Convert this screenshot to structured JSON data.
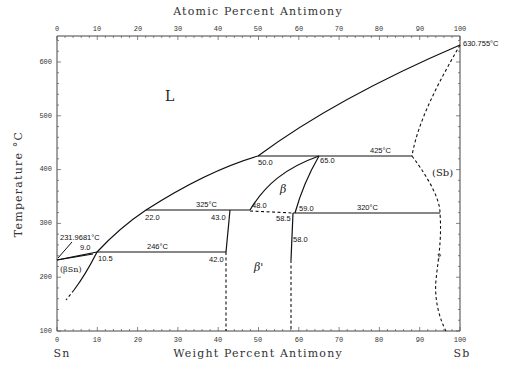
{
  "chart_data": {
    "type": "phase-diagram",
    "title_top": "Atomic Percent Antimony",
    "xlabel": "Weight Percent Antimony",
    "ylabel": "Temperature °C",
    "x_ticks_bottom": [
      "0",
      "10",
      "20",
      "30",
      "40",
      "50",
      "60",
      "70",
      "80",
      "90",
      "100"
    ],
    "x_ticks_top": [
      "0",
      "10",
      "20",
      "30",
      "40",
      "50",
      "60",
      "70",
      "80",
      "90",
      "100"
    ],
    "y_ticks": [
      "100",
      "200",
      "300",
      "400",
      "500",
      "600"
    ],
    "xlim": [
      0,
      100
    ],
    "ylim": [
      100,
      650
    ],
    "left_element": "Sn",
    "right_element": "Sb",
    "phases": {
      "liquid": "L",
      "sb": "(Sb)",
      "beta": "β",
      "beta_prime": "β'",
      "beta_sn": "(βSn)",
      "question": "?"
    },
    "melting_points": {
      "sn": "231.9681°C",
      "sb": "630.755°C"
    },
    "invariant_temps": {
      "t425": "425°C",
      "t325": "325°C",
      "t320": "320°C",
      "t246": "246°C"
    },
    "composition_labels": {
      "c9_0": "9.0",
      "c10_5": "10.5",
      "c22_0": "22.0",
      "c42_0": "42.0",
      "c43_0": "43.0",
      "c48_0": "48.0",
      "c50_0": "50.0",
      "c58_0": "58.0",
      "c58_5": "58.5",
      "c59_0": "59.0",
      "c65_0": "65.0"
    },
    "invariants": [
      {
        "T": 425,
        "from_wt": 50.0,
        "to_wt": 88
      },
      {
        "T": 325,
        "from_wt": 22.0,
        "to_wt": 48.0
      },
      {
        "T": 320,
        "from_wt": 58.5,
        "to_wt": 95
      },
      {
        "T": 246,
        "from_wt": 10.5,
        "to_wt": 42.0
      }
    ],
    "grid": false
  }
}
